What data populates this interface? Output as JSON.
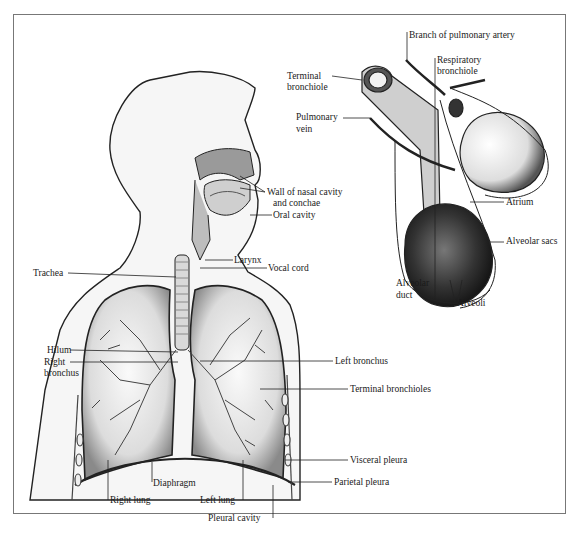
{
  "figure": {
    "border_color": "#777777",
    "ink_color": "#1a1a1a"
  },
  "body_diagram": {
    "labels": {
      "wall_nasal_1": "Wall of nasal cavity",
      "wall_nasal_2": "and conchae",
      "oral_cavity": "Oral cavity",
      "larynx": "Larynx",
      "vocal_cord": "Vocal cord",
      "trachea": "Trachea",
      "hilum": "Hilum",
      "right_bronchus_1": "Right",
      "right_bronchus_2": "bronchus",
      "left_bronchus": "Left bronchus",
      "terminal_bronchioles": "Terminal bronchioles",
      "visceral_pleura": "Visceral pleura",
      "parietal_pleura": "Parietal pleura",
      "diaphragm": "Diaphragm",
      "right_lung": "Right lung",
      "left_lung": "Left lung",
      "pleural_cavity": "Pleural cavity"
    }
  },
  "alveolus_diagram": {
    "labels": {
      "branch_pulmonary_artery": "Branch of pulmonary artery",
      "terminal_bronchiole_1": "Terminal",
      "terminal_bronchiole_2": "bronchiole",
      "respiratory_bronchiole_1": "Respiratory",
      "respiratory_bronchiole_2": "bronchiole",
      "pulmonary_vein_1": "Pulmonary",
      "pulmonary_vein_2": "vein",
      "atrium": "Atrium",
      "alveolar_sacs": "Alveolar sacs",
      "alveolar_duct_1": "Alveolar",
      "alveolar_duct_2": "duct",
      "alveoli": "Alveoli"
    }
  }
}
